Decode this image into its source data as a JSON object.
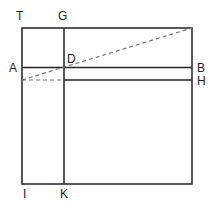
{
  "diagram": {
    "type": "geometric-figure",
    "labels": {
      "T": "T",
      "G": "G",
      "A": "A",
      "D": "D",
      "B": "B",
      "H": "H",
      "I": "I",
      "K": "K"
    },
    "colors": {
      "line": "#222222",
      "dashed": "#777777",
      "background": "#ffffff"
    }
  }
}
